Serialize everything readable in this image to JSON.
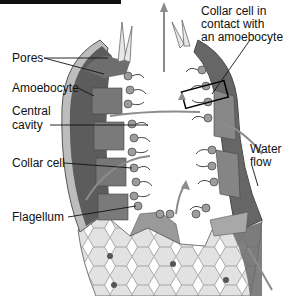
{
  "figure": {
    "labels": {
      "pores": "Pores",
      "amoebocyte": "Amoebocyte",
      "central_cavity_1": "Central",
      "central_cavity_2": "cavity",
      "collar_cell": "Collar cell",
      "flagellum": "Flagellum",
      "collar_contact_1": "Collar cell in",
      "collar_contact_2": "contact with",
      "collar_contact_3": "an amoebocyte",
      "water_flow_1": "Water",
      "water_flow_2": "flow"
    },
    "colors": {
      "body_dark": "#5a5a5a",
      "body_mid": "#8a8a8a",
      "body_light": "#c8c8c8",
      "arrow": "#8c8c8c",
      "text": "#111111"
    }
  }
}
